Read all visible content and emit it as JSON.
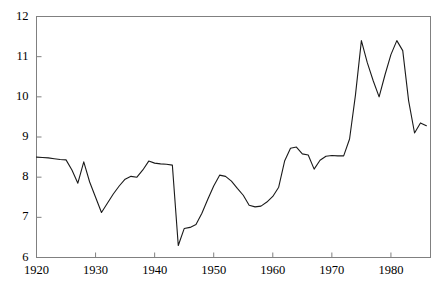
{
  "chart_data": {
    "type": "line",
    "title": "",
    "subtitle": "",
    "xlabel": "",
    "ylabel": "",
    "xlim": [
      1920,
      1986.7
    ],
    "ylim": [
      6,
      12
    ],
    "xticks": [
      1920,
      1930,
      1940,
      1950,
      1960,
      1970,
      1980
    ],
    "xtick_labels": [
      "1920",
      "1930",
      "1940",
      "1950",
      "1960",
      "1970",
      "1980"
    ],
    "yticks": [
      6,
      7,
      8,
      9,
      10,
      11,
      12
    ],
    "ytick_labels": [
      "6",
      "7",
      "8",
      "9",
      "10",
      "11",
      "12"
    ],
    "grid": false,
    "legend": "none",
    "line_color": "#1a1a1a",
    "line_width": 1.1,
    "frame_color": "#808080",
    "background": "#ffffff",
    "x": [
      1920,
      1921,
      1922,
      1923,
      1924,
      1925,
      1926,
      1927,
      1928,
      1929,
      1930,
      1931,
      1932,
      1933,
      1934,
      1935,
      1936,
      1937,
      1938,
      1939,
      1940,
      1941,
      1942,
      1943,
      1944,
      1945,
      1946,
      1947,
      1948,
      1949,
      1950,
      1951,
      1952,
      1953,
      1954,
      1955,
      1956,
      1957,
      1958,
      1959,
      1960,
      1961,
      1962,
      1963,
      1964,
      1965,
      1966,
      1967,
      1968,
      1969,
      1970,
      1971,
      1972,
      1973,
      1974,
      1975,
      1976,
      1977,
      1978,
      1979,
      1980,
      1981,
      1982,
      1983,
      1984,
      1985,
      1986
    ],
    "values": [
      8.5,
      8.49,
      8.48,
      8.46,
      8.44,
      8.43,
      8.18,
      7.85,
      8.38,
      7.88,
      7.5,
      7.12,
      7.35,
      7.58,
      7.78,
      7.95,
      8.02,
      8.0,
      8.18,
      8.4,
      8.35,
      8.33,
      8.32,
      8.3,
      6.3,
      6.72,
      6.75,
      6.82,
      7.1,
      7.45,
      7.78,
      8.05,
      8.02,
      7.9,
      7.72,
      7.55,
      7.3,
      7.26,
      7.28,
      7.38,
      7.52,
      7.75,
      8.4,
      8.72,
      8.75,
      8.58,
      8.55,
      8.2,
      8.42,
      8.52,
      8.54,
      8.53,
      8.53,
      8.95,
      10.05,
      11.4,
      10.85,
      10.4,
      10.0,
      10.55,
      11.05,
      11.4,
      11.15,
      9.9,
      9.1,
      9.35,
      9.28
    ],
    "series_name": "value"
  }
}
